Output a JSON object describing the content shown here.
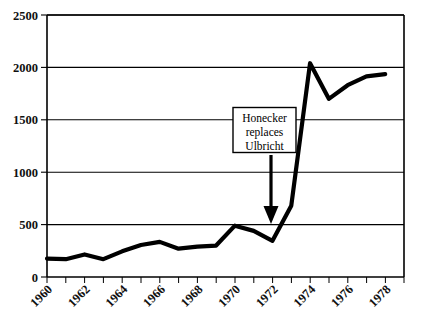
{
  "chart_data": {
    "type": "line",
    "title": "",
    "xlabel": "",
    "ylabel": "",
    "x": [
      1960,
      1961,
      1962,
      1963,
      1964,
      1965,
      1966,
      1967,
      1968,
      1969,
      1970,
      1971,
      1972,
      1973,
      1974,
      1975,
      1976,
      1977,
      1978
    ],
    "values": [
      175,
      170,
      215,
      170,
      245,
      305,
      335,
      270,
      290,
      300,
      490,
      440,
      345,
      680,
      2040,
      1700,
      1830,
      1915,
      1935
    ],
    "series": [
      {
        "name": "",
        "values": [
          175,
          170,
          215,
          170,
          245,
          305,
          335,
          270,
          290,
          300,
          490,
          440,
          345,
          680,
          2040,
          1700,
          1830,
          1915,
          1935
        ]
      }
    ],
    "xlim": [
      1960,
      1979
    ],
    "ylim": [
      0,
      2500
    ],
    "ytick_labels": [
      "0",
      "500",
      "1000",
      "1500",
      "2000",
      "2500"
    ],
    "ytick_values": [
      0,
      500,
      1000,
      1500,
      2000,
      2500
    ],
    "xtick_labels": [
      "1960",
      "1962",
      "1964",
      "1966",
      "1968",
      "1970",
      "1972",
      "1974",
      "1976",
      "1978"
    ],
    "xtick_values": [
      1960,
      1962,
      1964,
      1966,
      1968,
      1970,
      1972,
      1974,
      1976,
      1978
    ],
    "xtick_minor_step": 1,
    "grid": "horizontal",
    "legend": "none",
    "line_color": "#000000",
    "background_color": "#ffffff",
    "annotations": [
      {
        "name": "honecker-annotation",
        "lines": [
          "Honecker",
          "replaces",
          "Ulbricht"
        ],
        "text": "Honecker replaces Ulbricht",
        "points_to_year": 1972,
        "arrow": "down"
      }
    ]
  }
}
